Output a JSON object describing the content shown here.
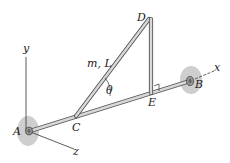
{
  "figure": {
    "type": "mechanics-diagram"
  },
  "axes": {
    "x": "x",
    "y": "y",
    "z": "z"
  },
  "points": {
    "A": "A",
    "B": "B",
    "C": "C",
    "D": "D",
    "E": "E"
  },
  "labels": {
    "rod_CD": "m, L",
    "angle": "θ"
  },
  "colors": {
    "rod_fill": "#d8d8d8",
    "rod_edge": "#555555",
    "bearing": "#bdbdbd",
    "axis_line": "#333333"
  }
}
